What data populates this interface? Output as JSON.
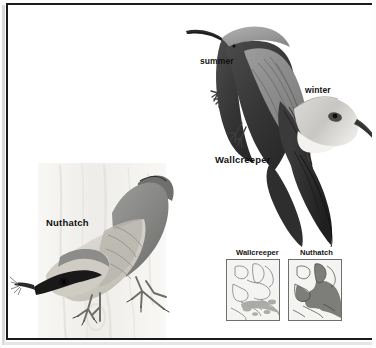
{
  "plate": {
    "type": "field-guide-illustration-plate",
    "background_color": "#ffffff",
    "frame_color": "#1a1a1a"
  },
  "labels": {
    "summer": "summer",
    "winter": "winter",
    "wallcreeper": "Wallcreeper",
    "nuthatch": "Nuthatch"
  },
  "maps": {
    "wallcreeper": {
      "title": "Wallcreeper",
      "land_color": "#f4f4f2",
      "range_color": "#a8a8a4",
      "coast_color": "#6e6e6e"
    },
    "nuthatch": {
      "title": "Nuthatch",
      "land_color": "#f4f4f2",
      "range_color": "#7d7d7a",
      "coast_color": "#6e6e6e"
    }
  },
  "art": {
    "wallcreeper_summer": {
      "body_color": "#3a3a3a",
      "wing_color": "#8f8f8f",
      "crown_color": "#9a9a9a",
      "bill_color": "#2b2b2b"
    },
    "wallcreeper_winter": {
      "head_color": "#c9c9c7",
      "throat_color": "#f2f2f0",
      "eye_color": "#1d1d1d"
    },
    "nuthatch": {
      "back_color": "#8d8d8c",
      "underpart_color": "#d5d3cd",
      "eyestripe_color": "#1b1b1b",
      "bark_color": "#e9e8e4"
    }
  }
}
